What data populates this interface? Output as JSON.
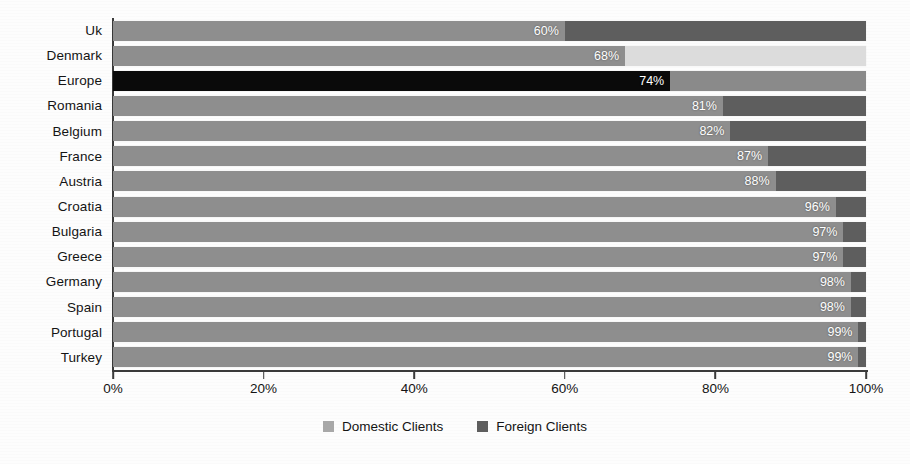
{
  "chart_data": {
    "type": "bar",
    "orientation": "horizontal",
    "stacked": true,
    "normalized_percent": true,
    "title": "",
    "subtitle": "",
    "xlabel": "",
    "ylabel": "",
    "xlim": [
      0,
      100
    ],
    "grid": false,
    "legend_position": "bottom-center",
    "categories": [
      "Uk",
      "Denmark",
      "Europe",
      "Romania",
      "Belgium",
      "France",
      "Austria",
      "Croatia",
      "Bulgaria",
      "Greece",
      "Germany",
      "Spain",
      "Portugal",
      "Turkey"
    ],
    "tick_labels": [
      "0%",
      "20%",
      "40%",
      "60%",
      "80%",
      "100%"
    ],
    "tick_values": [
      0,
      20,
      40,
      60,
      80,
      100
    ],
    "series": [
      {
        "name": "Domestic Clients",
        "color": "#8e8e8e",
        "values": [
          60,
          68,
          74,
          81,
          82,
          87,
          88,
          96,
          97,
          97,
          98,
          98,
          99,
          99
        ]
      },
      {
        "name": "Foreign Clients",
        "color": "#5e5e5e",
        "values": [
          40,
          32,
          26,
          19,
          18,
          13,
          12,
          4,
          3,
          3,
          2,
          2,
          1,
          1
        ]
      }
    ],
    "data_labels": [
      "60%",
      "68%",
      "74%",
      "81%",
      "82%",
      "87%",
      "88%",
      "96%",
      "97%",
      "97%",
      "98%",
      "98%",
      "99%",
      "99%"
    ],
    "highlight": {
      "category": "Europe",
      "domestic_color": "#0a0a0a",
      "foreign_color": "#8a8a8a"
    },
    "row_overrides": [
      {
        "category": "Denmark",
        "foreign_color": "#dcdcdc"
      }
    ]
  },
  "legend": {
    "items": [
      {
        "label": "Domestic Clients",
        "color": "#a8a8a8"
      },
      {
        "label": "Foreign Clients",
        "color": "#5e5e5e"
      }
    ]
  },
  "colors": {
    "axis": "#3a3a3a",
    "text": "#141414",
    "bar_domestic": "#8e8e8e",
    "bar_foreign": "#5e5e5e",
    "bar_highlight": "#0a0a0a",
    "background": "#fdfdfd",
    "label_text": "#ffffff"
  }
}
